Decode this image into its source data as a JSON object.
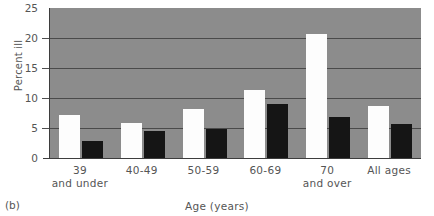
{
  "figure": {
    "panel_label": "(b)",
    "background_color": "#8c8c8c",
    "page_background": "#ffffff"
  },
  "axes": {
    "ylabel": "Percent ill",
    "xlabel": "Age (years)",
    "yticks": [
      "0",
      "5",
      "10",
      "15",
      "20",
      "25"
    ]
  },
  "series_colors": {
    "series1": "#fdfdfd",
    "series2": "#151515"
  },
  "chart_data": {
    "type": "bar",
    "title": "",
    "xlabel": "Age (years)",
    "ylabel": "Percent ill",
    "ylim": [
      0,
      25
    ],
    "ytick_values": [
      0,
      5,
      10,
      15,
      20,
      25
    ],
    "grid": true,
    "grid_axis": "y",
    "legend": "none",
    "categories": [
      "39\nand under",
      "40-49",
      "50-59",
      "60-69",
      "70\nand over",
      "All ages"
    ],
    "series": [
      {
        "name": "series1",
        "color": "#fdfdfd",
        "values": [
          7.1,
          5.9,
          8.2,
          11.4,
          20.6,
          8.7
        ]
      },
      {
        "name": "series2",
        "color": "#151515",
        "values": [
          2.9,
          4.5,
          4.8,
          9.0,
          6.9,
          5.6
        ]
      }
    ]
  }
}
